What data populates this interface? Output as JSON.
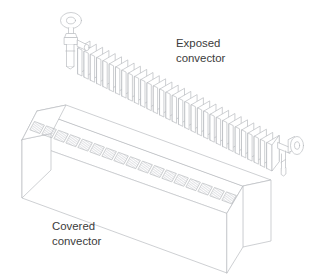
{
  "figure": {
    "background_color": "#ffffff",
    "line_color": "#b9bcc0",
    "accent_line_color": "#9a9da1",
    "fill_color": "#ffffff",
    "hatch_color": "#c6c9cd",
    "text_color": "#3b3b3b",
    "type": "technical-line-drawing",
    "projection": "isometric"
  },
  "labels": {
    "exposed": {
      "line1": "Exposed",
      "line2": "convector"
    },
    "covered": {
      "line1": "Covered",
      "line2": "convector"
    }
  },
  "exposed_convector": {
    "name": "exposed-convector",
    "fin_count": 30,
    "fin_width": 15,
    "fin_height": 26,
    "fin_pitch": 6.3,
    "start_x": 78,
    "start_y": 48,
    "dx": 6.3,
    "dy": 3.15,
    "valves": [
      {
        "name": "left-valve",
        "handwheel": "ellipse",
        "orientation": "vertical",
        "cx": 71,
        "cy": 21
      },
      {
        "name": "right-valve",
        "handwheel": "ellipse",
        "orientation": "horizontal",
        "cx": 295,
        "cy": 144
      }
    ]
  },
  "covered_convector": {
    "name": "covered-convector",
    "grille_slot_count": 17,
    "body_length": 208,
    "body_height": 58,
    "body_depth": 30,
    "front_top_left_x": 22,
    "front_top_left_y": 140,
    "bevel": true
  }
}
